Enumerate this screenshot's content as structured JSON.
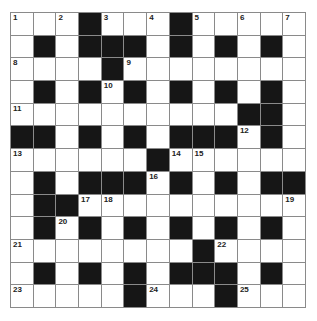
{
  "puzzle": {
    "rows": 13,
    "cols": 13,
    "colors": {
      "block": "#161616",
      "cell": "#ffffff",
      "line": "#8a8a8a",
      "number": "#222222"
    },
    "layout": [
      "...#...#.....",
      ".#.###.#.#.#.",
      "....#........",
      ".#.#.#.#.#.#.",
      "..........##.",
      "##.#.#.###.#.",
      "......#......",
      ".#.###.#.#.##",
      ".##..........",
      ".#.#.#.#.#.#.",
      "........#....",
      ".#.#.#.###.#.",
      ".....#...#..."
    ],
    "numbers": [
      {
        "n": "1",
        "r": 0,
        "c": 0
      },
      {
        "n": "2",
        "r": 0,
        "c": 2
      },
      {
        "n": "3",
        "r": 0,
        "c": 4
      },
      {
        "n": "4",
        "r": 0,
        "c": 6
      },
      {
        "n": "5",
        "r": 0,
        "c": 8
      },
      {
        "n": "6",
        "r": 0,
        "c": 10
      },
      {
        "n": "7",
        "r": 0,
        "c": 12
      },
      {
        "n": "8",
        "r": 2,
        "c": 0
      },
      {
        "n": "9",
        "r": 2,
        "c": 5
      },
      {
        "n": "10",
        "r": 3,
        "c": 4
      },
      {
        "n": "11",
        "r": 4,
        "c": 0
      },
      {
        "n": "12",
        "r": 5,
        "c": 10
      },
      {
        "n": "13",
        "r": 6,
        "c": 0
      },
      {
        "n": "14",
        "r": 6,
        "c": 7
      },
      {
        "n": "15",
        "r": 6,
        "c": 8
      },
      {
        "n": "16",
        "r": 7,
        "c": 6
      },
      {
        "n": "17",
        "r": 8,
        "c": 3
      },
      {
        "n": "18",
        "r": 8,
        "c": 4
      },
      {
        "n": "19",
        "r": 8,
        "c": 12
      },
      {
        "n": "20",
        "r": 9,
        "c": 2
      },
      {
        "n": "21",
        "r": 10,
        "c": 0
      },
      {
        "n": "22",
        "r": 10,
        "c": 9
      },
      {
        "n": "23",
        "r": 12,
        "c": 0
      },
      {
        "n": "24",
        "r": 12,
        "c": 6
      },
      {
        "n": "25",
        "r": 12,
        "c": 10
      }
    ]
  }
}
